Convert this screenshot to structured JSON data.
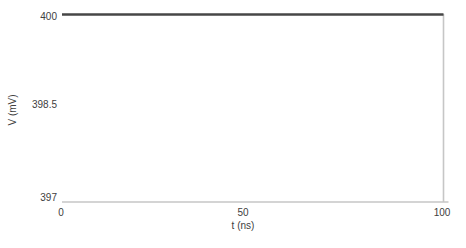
{
  "chart_data": {
    "type": "line",
    "title": "",
    "xlabel": "t (ns)",
    "ylabel": "V (mV)",
    "xlim": [
      0,
      100
    ],
    "ylim": [
      397,
      400
    ],
    "xticks": [
      "0",
      "50",
      "100"
    ],
    "yticks": [
      "400",
      "398.5",
      "397"
    ],
    "grid": false,
    "legend": "none",
    "axis_color": "#c6c6c6",
    "text_color": "#404040",
    "frame": {
      "bottom": true,
      "right": true,
      "left": false,
      "top": false
    },
    "series": [
      {
        "name": "V",
        "color": "#464646",
        "width": 2.6,
        "points": [
          [
            0,
            400
          ],
          [
            100,
            400
          ]
        ]
      }
    ]
  }
}
